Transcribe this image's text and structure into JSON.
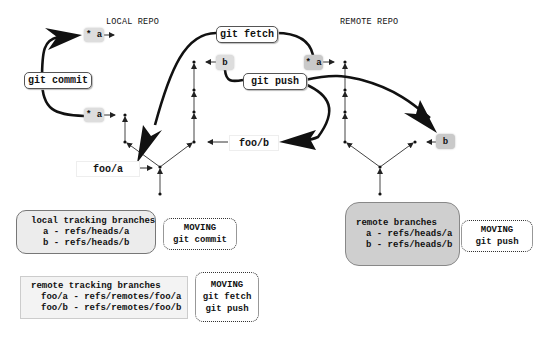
{
  "local_repo": {
    "title": "LOCAL REPO",
    "refs": {
      "a_new": "* a",
      "a_old": "* a",
      "b": "b",
      "foo_a": "foo/a",
      "foo_b": "foo/b"
    }
  },
  "remote_repo": {
    "title": "REMOTE REPO",
    "refs": {
      "a": "* a",
      "b": "b"
    }
  },
  "commands": {
    "commit": "git commit",
    "fetch": "git fetch",
    "push": "git push"
  },
  "legend": {
    "local_tracking": {
      "title": "local tracking branches",
      "lines": [
        "a - refs/heads/a",
        "b - refs/heads/b"
      ],
      "moving_label": "MOVING",
      "moving_commands": [
        "git commit"
      ]
    },
    "remote_tracking": {
      "title": "remote tracking branches",
      "lines": [
        "foo/a - refs/remotes/foo/a",
        "foo/b - refs/remotes/foo/b"
      ],
      "moving_label": "MOVING",
      "moving_commands": [
        "git fetch",
        "git push"
      ]
    },
    "remote_branches": {
      "title": "remote branches",
      "lines": [
        "a - refs/heads/a",
        "b - refs/heads/b"
      ],
      "moving_label": "MOVING",
      "moving_commands": [
        "git push"
      ]
    }
  },
  "colors": {
    "ref_fill": "#dddddd",
    "remote_box_fill": "#cfcfcf",
    "local_box_fill": "#ececec",
    "line": "#111111"
  }
}
